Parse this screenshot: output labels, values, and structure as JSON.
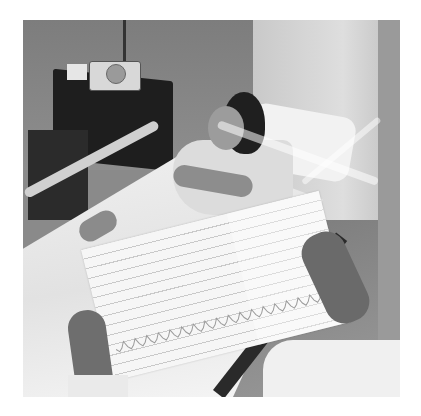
{
  "image": {
    "description": "Black-and-white photograph of a hospital room: a patient lying in bed with a breathing tube, while a clinician holds an ECG printout strip in the foreground.",
    "palette": {
      "background": "#ffffff",
      "wall": "#8a8a8a",
      "sheet": "#f0f0f0",
      "nightstand": "#1e1e1e",
      "paper": "#f6f6f6",
      "grid_line": "#c9c9c9",
      "trace": "#9a9a9a"
    },
    "elements": {
      "nightstand": "bedside table",
      "monitor": "bedside monitor device",
      "tissue_box": "tissue box",
      "bed": "hospital bed",
      "bed_rail": "bed rail",
      "pillow": "pillow",
      "patient": "patient",
      "breathing_tube": "ventilator tubing",
      "ecg_strip": "ECG printout",
      "clinician_hands": "clinician hands holding strip",
      "sleeve": "white coat sleeve"
    }
  }
}
